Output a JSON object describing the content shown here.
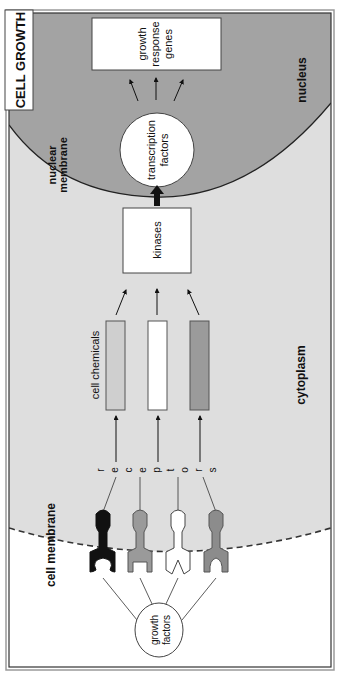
{
  "title": "CELL GROWTH",
  "regions": {
    "nucleus": "nucleus",
    "nuclear_membrane": [
      "nuclear",
      "membrane"
    ],
    "cytoplasm": "cytoplasm",
    "cell_membrane": "cell membrane"
  },
  "nodes": {
    "growth_response_genes": [
      "growth",
      "response",
      "genes"
    ],
    "transcription_factors": [
      "transcription",
      "factors"
    ],
    "kinases": "kinases",
    "cell_chemicals": "cell chemicals",
    "receptors_letters": [
      "r",
      "e",
      "c",
      "e",
      "p",
      "t",
      "o",
      "r",
      "s"
    ],
    "growth_factors": [
      "growth",
      "factors"
    ]
  },
  "colors": {
    "nucleus_fill": "#a3a3a3",
    "cytoplasm_fill": "#dedede",
    "outside_fill": "#ffffff",
    "bar_light": "#cfcfcf",
    "bar_white": "#ffffff",
    "bar_dark": "#9b9b9b",
    "receptor_black": "#111111",
    "receptor_gray": "#9a9a9a",
    "receptor_white": "#ffffff",
    "receptor_darkgray": "#8c8c8c"
  }
}
